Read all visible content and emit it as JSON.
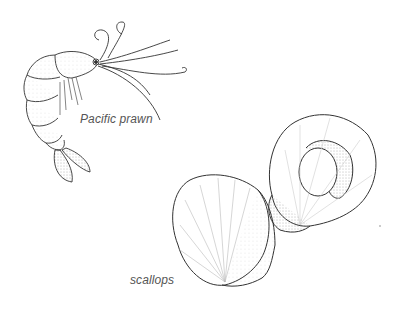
{
  "illustration": {
    "style": "black-and-white pen stipple drawing",
    "background": "#ffffff",
    "line_color": "#333333",
    "subjects": [
      {
        "name": "prawn",
        "label": "Pacific prawn"
      },
      {
        "name": "scallops",
        "label": "scallops"
      }
    ]
  }
}
